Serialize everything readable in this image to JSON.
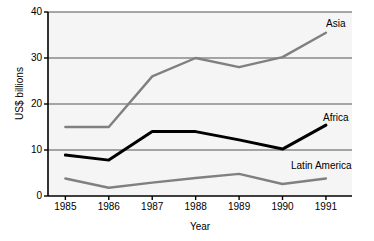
{
  "chart_data": {
    "type": "line",
    "title": "",
    "xlabel": "Year",
    "ylabel": "US$ billions",
    "categories": [
      "1985",
      "1986",
      "1987",
      "1988",
      "1989",
      "1990",
      "1991"
    ],
    "x": [
      1985,
      1986,
      1987,
      1988,
      1989,
      1990,
      1991
    ],
    "xlim": [
      1984.6,
      1991.6
    ],
    "ylim": [
      0,
      40
    ],
    "yticks": [
      0,
      10,
      20,
      30,
      40
    ],
    "ytick_labels": [
      "0",
      "10",
      "20",
      "30",
      "40"
    ],
    "grid": "horizontal",
    "legend_position": "inline-right",
    "series": [
      {
        "name": "Asia",
        "color": "#808080",
        "width": 2.4,
        "values": [
          15,
          15,
          26,
          30,
          28,
          30.2,
          35.5
        ],
        "label_x": 326,
        "label_y": 19
      },
      {
        "name": "Africa",
        "color": "#000000",
        "width": 3.0,
        "values": [
          8.9,
          7.8,
          14,
          14,
          12.2,
          10.2,
          15.4
        ],
        "label_x": 323,
        "label_y": 113
      },
      {
        "name": "Latin America",
        "color": "#808080",
        "width": 2.4,
        "values": [
          3.8,
          1.8,
          2.9,
          3.9,
          4.8,
          2.6,
          3.8
        ],
        "label_x": 291,
        "label_y": 161
      }
    ]
  },
  "axes": {
    "y_title": "US$ billions",
    "x_title": "Year",
    "y_tick_labels": [
      "0",
      "10",
      "20",
      "30",
      "40"
    ],
    "x_tick_labels": [
      "1985",
      "1986",
      "1987",
      "1988",
      "1989",
      "1990",
      "1991"
    ]
  },
  "style": {
    "plot_background": "#ececec",
    "page_background": "#ffffff",
    "axis_color": "#000000",
    "grid_color": "#555555",
    "asia_color": "#808080",
    "africa_color": "#000000",
    "latin_america_color": "#808080"
  }
}
